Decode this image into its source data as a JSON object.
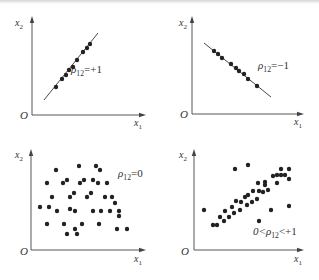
{
  "panels": [
    {
      "id": "perfect-positive",
      "annotation": "ρ12=+1",
      "ann_main": "ρ",
      "ann_sub": "12",
      "ann_rest": "=+1",
      "origin_label": "O",
      "xlabel_main": "x",
      "xlabel_sub": "1",
      "ylabel_main": "x",
      "ylabel_sub": "2",
      "axis": {
        "ox": 32,
        "oy": 115,
        "xend": 142,
        "ytop": 20
      },
      "label_pos": {
        "ann": [
          71,
          73
        ],
        "o": [
          20,
          119
        ],
        "xl": [
          134,
          126
        ],
        "yl": [
          15,
          26
        ]
      },
      "line": [
        44,
        100,
        98,
        33
      ],
      "points": [
        [
          56,
          87
        ],
        [
          62,
          79
        ],
        [
          66,
          75
        ],
        [
          69,
          70
        ],
        [
          73,
          67
        ],
        [
          77,
          60
        ],
        [
          83,
          52
        ],
        [
          87,
          48
        ],
        [
          90,
          44
        ]
      ]
    },
    {
      "id": "perfect-negative",
      "annotation": "ρ12=−1",
      "ann_main": "ρ",
      "ann_sub": "12",
      "ann_rest": "=−1",
      "origin_label": "O",
      "xlabel_main": "x",
      "xlabel_sub": "1",
      "ylabel_main": "x",
      "ylabel_sub": "2",
      "axis": {
        "ox": 192,
        "oy": 114,
        "xend": 300,
        "ytop": 20
      },
      "label_pos": {
        "ann": [
          258,
          69
        ],
        "o": [
          180,
          118
        ],
        "xl": [
          294,
          125
        ],
        "yl": [
          179,
          26
        ]
      },
      "line": [
        204,
        43,
        271,
        97
      ],
      "points": [
        [
          214,
          51
        ],
        [
          218,
          54
        ],
        [
          222,
          58
        ],
        [
          231,
          64
        ],
        [
          236,
          68
        ],
        [
          239,
          71
        ],
        [
          244,
          74
        ],
        [
          248,
          79
        ],
        [
          257,
          86
        ]
      ]
    },
    {
      "id": "no-correlation",
      "annotation": "ρ12=0",
      "ann_main": "ρ",
      "ann_sub": "12",
      "ann_rest": "=0",
      "origin_label": "O",
      "xlabel_main": "x",
      "xlabel_sub": "1",
      "ylabel_main": "x",
      "ylabel_sub": "2",
      "axis": {
        "ox": 31,
        "oy": 250,
        "xend": 142,
        "ytop": 153
      },
      "label_pos": {
        "ann": [
          118,
          177
        ],
        "o": [
          20,
          255
        ],
        "xl": [
          134,
          262
        ],
        "yl": [
          15,
          158
        ]
      },
      "line": null,
      "points": [
        [
          56,
          170
        ],
        [
          79,
          166
        ],
        [
          96,
          166
        ],
        [
          100,
          170
        ],
        [
          47,
          183
        ],
        [
          63,
          183
        ],
        [
          67,
          180
        ],
        [
          80,
          183
        ],
        [
          84,
          180
        ],
        [
          93,
          180
        ],
        [
          98,
          183
        ],
        [
          107,
          183
        ],
        [
          52,
          197
        ],
        [
          70,
          197
        ],
        [
          74,
          193
        ],
        [
          87,
          197
        ],
        [
          91,
          193
        ],
        [
          105,
          197
        ],
        [
          112,
          197
        ],
        [
          115,
          203
        ],
        [
          40,
          207
        ],
        [
          49,
          207
        ],
        [
          57,
          211
        ],
        [
          70,
          209
        ],
        [
          75,
          211
        ],
        [
          93,
          211
        ],
        [
          101,
          211
        ],
        [
          110,
          211
        ],
        [
          119,
          211
        ],
        [
          119,
          216
        ],
        [
          47,
          224
        ],
        [
          64,
          224
        ],
        [
          82,
          224
        ],
        [
          99,
          224
        ],
        [
          75,
          229
        ],
        [
          117,
          229
        ],
        [
          127,
          229
        ],
        [
          67,
          234
        ],
        [
          77,
          234
        ]
      ]
    },
    {
      "id": "partial-positive",
      "annotation": "0<ρ12<+1",
      "ann_main": "0<ρ",
      "ann_sub": "12",
      "ann_rest": "<+1",
      "origin_label": "O",
      "xlabel_main": "x",
      "xlabel_sub": "1",
      "ylabel_main": "x",
      "ylabel_sub": "2",
      "axis": {
        "ox": 194,
        "oy": 250,
        "xend": 300,
        "ytop": 153
      },
      "label_pos": {
        "ann": [
          253,
          235
        ],
        "o": [
          181,
          255
        ],
        "xl": [
          294,
          262
        ],
        "yl": [
          179,
          158
        ]
      },
      "line": null,
      "points": [
        [
          204,
          210
        ],
        [
          213,
          225
        ],
        [
          217,
          225
        ],
        [
          220,
          217
        ],
        [
          224,
          221
        ],
        [
          225,
          211
        ],
        [
          229,
          217
        ],
        [
          232,
          207
        ],
        [
          234,
          213
        ],
        [
          236,
          201
        ],
        [
          240,
          210
        ],
        [
          241,
          202
        ],
        [
          245,
          197
        ],
        [
          247,
          205
        ],
        [
          248,
          195
        ],
        [
          252,
          202
        ],
        [
          253,
          191
        ],
        [
          257,
          199
        ],
        [
          258,
          183
        ],
        [
          259,
          191
        ],
        [
          263,
          192
        ],
        [
          265,
          182
        ],
        [
          265,
          185
        ],
        [
          268,
          190
        ],
        [
          271,
          210
        ],
        [
          273,
          176
        ],
        [
          277,
          183
        ],
        [
          277,
          175
        ],
        [
          281,
          169
        ],
        [
          281,
          175
        ],
        [
          285,
          175
        ],
        [
          289,
          169
        ],
        [
          289,
          179
        ],
        [
          289,
          206
        ],
        [
          235,
          169
        ],
        [
          248,
          165
        ],
        [
          259,
          221
        ]
      ]
    }
  ],
  "colors": {
    "ink": "#222222",
    "axis": "#444444",
    "text": "#333333",
    "background": "#ffffff"
  }
}
